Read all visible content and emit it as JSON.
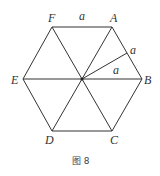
{
  "figure": {
    "caption": "图 8",
    "vertices": {
      "A": "A",
      "B": "B",
      "C": "C",
      "D": "D",
      "E": "E",
      "F": "F"
    },
    "side_labels": {
      "FA": "a",
      "AB_half": "a",
      "O_to_mid_AB": "a"
    },
    "line_color": "#333333"
  }
}
